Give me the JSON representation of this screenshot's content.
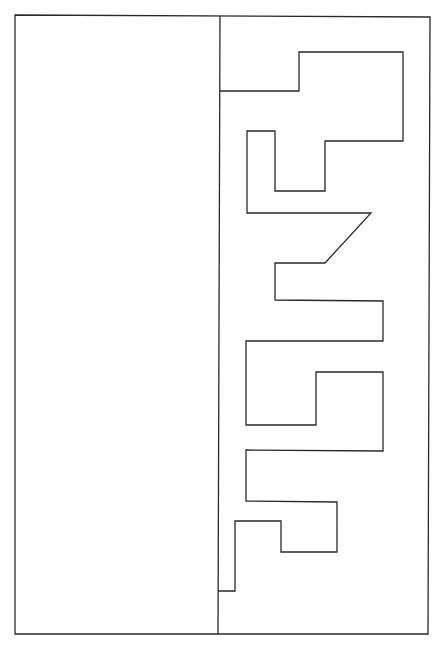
{
  "diagram": {
    "stroke_color": "#2a2a2a",
    "background": "#ffffff",
    "outer_frame": {
      "x1": 15,
      "y1": 15,
      "x2": 430,
      "y2": 634
    },
    "divider": {
      "x": 219,
      "y1": 16,
      "y2": 634
    },
    "path_points": "220,91 299,91 299,52 403,52 403,141 325,141 325,191 275,191 275,131 247,131 247,213 371,213 325,263 275,263 275,300 383,301 383,341 246,341 246,425 316,425 316,372 383,372 383,451 246,450 246,501 337,502 337,552 281,552 281,521 235,521 235,591 218,591"
  }
}
